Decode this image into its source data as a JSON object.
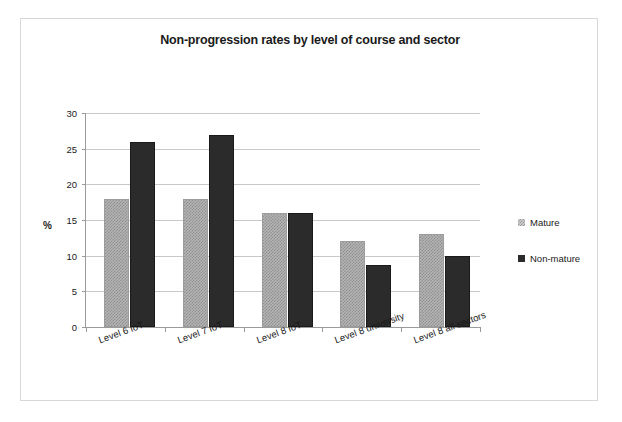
{
  "scan": {
    "cut_off_line": "· ·· ·  ·· · ···· ·· ·   ··· · ·· ··· ·· ·  ·· ·· ··· ·"
  },
  "chart_data": {
    "type": "bar",
    "title": "Non-progression rates by level of course and sector",
    "xlabel": "",
    "ylabel": "%",
    "ylim": [
      0,
      30
    ],
    "yticks": [
      0,
      5,
      10,
      15,
      20,
      25,
      30
    ],
    "ytick_labels": [
      "0",
      "5",
      "10",
      "15",
      "20",
      "25",
      "30"
    ],
    "grid": true,
    "legend_position": "right",
    "categories": [
      "Level 6 IoT",
      "Level 7 IoT",
      "Level 8 IoT",
      "Level 8 university",
      "Level 8 all sectors"
    ],
    "series": [
      {
        "name": "Mature",
        "color": "#b5b5b5",
        "pattern": "checkered",
        "values": [
          18,
          18,
          16,
          12,
          13
        ]
      },
      {
        "name": "Non-mature",
        "color": "#2b2b2b",
        "pattern": "solid",
        "values": [
          26,
          26.9,
          16,
          8.7,
          9.9
        ]
      }
    ]
  },
  "colors": {
    "mature": "#b5b5b5",
    "non_mature": "#2b2b2b",
    "gridline": "#c9c9c9",
    "axis": "#9a9a9a",
    "card_border": "#d8d8d8",
    "text": "#1a1a1a"
  }
}
